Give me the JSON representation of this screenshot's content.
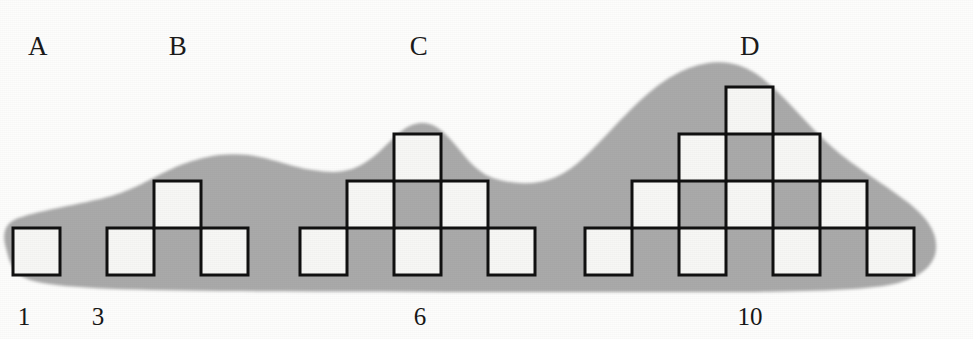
{
  "figure": {
    "canvas": {
      "width": 973,
      "height": 339
    },
    "background_color": "#fdfdfc",
    "blob_color": "#a9a9a9",
    "square_fill": "#f7f7f5",
    "square_stroke": "#111111",
    "square_size": 47,
    "stroke_width": 3
  },
  "groups": [
    {
      "id": "A",
      "label": "A",
      "label_x": 38,
      "label_y": 33,
      "count": 1,
      "count_label": "1",
      "count_x": 24,
      "count_y": 304,
      "rows": 1,
      "squares": [
        {
          "x": 13,
          "y": 228
        }
      ]
    },
    {
      "id": "B",
      "label": "B",
      "label_x": 178,
      "label_y": 33,
      "count": 3,
      "count_label": "3",
      "count_x": 98,
      "count_y": 304,
      "rows": 2,
      "squares": [
        {
          "x": 107,
          "y": 228
        },
        {
          "x": 201,
          "y": 228
        },
        {
          "x": 154,
          "y": 181
        }
      ]
    },
    {
      "id": "C",
      "label": "C",
      "label_x": 419,
      "label_y": 33,
      "count": 6,
      "count_label": "6",
      "count_x": 420,
      "count_y": 304,
      "rows": 3,
      "squares": [
        {
          "x": 300,
          "y": 228
        },
        {
          "x": 394,
          "y": 228
        },
        {
          "x": 488,
          "y": 228
        },
        {
          "x": 347,
          "y": 181
        },
        {
          "x": 441,
          "y": 181
        },
        {
          "x": 394,
          "y": 134
        }
      ]
    },
    {
      "id": "D",
      "label": "D",
      "label_x": 750,
      "label_y": 33,
      "count": 10,
      "count_label": "10",
      "count_x": 750,
      "count_y": 304,
      "rows": 4,
      "squares": [
        {
          "x": 585,
          "y": 228
        },
        {
          "x": 679,
          "y": 228
        },
        {
          "x": 773,
          "y": 228
        },
        {
          "x": 867,
          "y": 228
        },
        {
          "x": 632,
          "y": 181
        },
        {
          "x": 726,
          "y": 181
        },
        {
          "x": 820,
          "y": 181
        },
        {
          "x": 679,
          "y": 134
        },
        {
          "x": 773,
          "y": 134
        },
        {
          "x": 726,
          "y": 87
        }
      ]
    }
  ],
  "blob": {
    "name": "shaded-background-blob",
    "path": "M 6,248 C 2,236 4,224 16,219 C 36,211 72,206 104,198 C 136,190 154,176 178,166 C 200,157 224,152 248,155 C 272,158 288,166 312,170 C 338,174 350,172 366,162 C 384,151 396,131 412,125 C 428,119 440,127 452,141 C 466,157 476,173 496,179 C 516,185 538,185 556,177 C 576,168 592,150 612,129 C 636,104 660,78 692,67 C 718,58 742,62 762,78 C 786,97 806,124 832,147 C 856,168 884,184 906,201 C 926,216 938,232 936,250 C 934,266 920,277 898,283 C 866,291 800,292 700,292 C 560,292 380,292 220,291 C 120,290 56,288 30,280 C 12,274 9,260 6,248 Z"
  }
}
